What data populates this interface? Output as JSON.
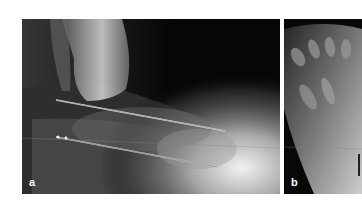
{
  "figure": {
    "panels": [
      {
        "label": "a",
        "description": "Lateral radiograph of foot and ankle with two reference lines",
        "reference_lines": [
          {
            "name": "upper-axis-line",
            "x1": 34,
            "y1": 81,
            "x2": 203,
            "y2": 112
          },
          {
            "name": "lower-axis-line",
            "x1": 34,
            "y1": 118,
            "x2": 195,
            "y2": 148
          }
        ]
      },
      {
        "label": "b",
        "description": "Dorsoplantar radiograph of forefoot (cropped)"
      }
    ],
    "colors": {
      "background": "#ffffff",
      "xray_dark": "#050505",
      "label": "#ffffff",
      "line": "#e8e8e8"
    }
  }
}
